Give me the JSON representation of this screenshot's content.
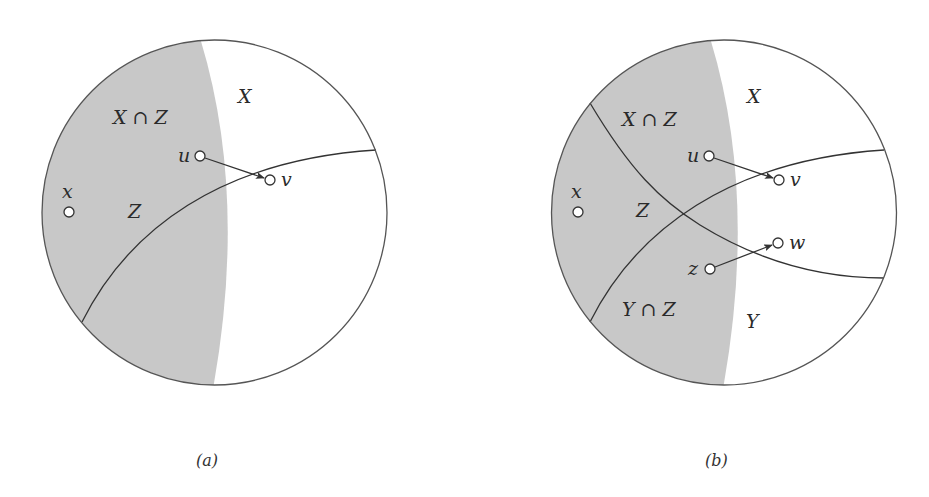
{
  "figure": {
    "shade_color": "#c8c8c8",
    "panels": [
      {
        "id": "a",
        "caption": "(a)",
        "labels": {
          "X": "X",
          "X_cap_Z": "X ∩ Z",
          "Z": "Z"
        },
        "nodes": {
          "u": "u",
          "v": "v",
          "x": "x"
        },
        "edges": [
          {
            "from": "u",
            "to": "v"
          }
        ]
      },
      {
        "id": "b",
        "caption": "(b)",
        "labels": {
          "X": "X",
          "X_cap_Z": "X ∩ Z",
          "Z": "Z",
          "Y": "Y",
          "Y_cap_Z": "Y ∩ Z"
        },
        "nodes": {
          "u": "u",
          "v": "v",
          "x": "x",
          "z": "z",
          "w": "w"
        },
        "edges": [
          {
            "from": "u",
            "to": "v"
          },
          {
            "from": "z",
            "to": "w"
          }
        ]
      }
    ]
  }
}
